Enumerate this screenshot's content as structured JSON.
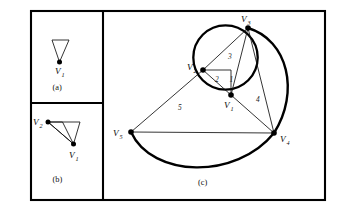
{
  "figure": {
    "kind": "geometry-diagram",
    "background_color": "#ffffff",
    "ink_color": "#000000",
    "panels": [
      {
        "id": "a",
        "caption": "(a)",
        "vertices": [
          {
            "name": "V1",
            "label": "V",
            "subscript": "1",
            "dot": true
          }
        ],
        "description": "narrow downward-pointing triangle with apex dot at V1"
      },
      {
        "id": "b",
        "caption": "(b)",
        "vertices": [
          {
            "name": "V2",
            "label": "V",
            "subscript": "2",
            "dot": true
          },
          {
            "name": "V1",
            "label": "V",
            "subscript": "1",
            "dot": true
          }
        ],
        "description": "V2 upper-left joined to V1 lower-right plus narrow triangle"
      },
      {
        "id": "c",
        "caption": "(c)",
        "vertices": [
          {
            "name": "V1",
            "label": "V",
            "subscript": "1",
            "dot": true
          },
          {
            "name": "V2",
            "label": "V",
            "subscript": "2",
            "dot": true
          },
          {
            "name": "V3",
            "label": "V",
            "subscript": "3",
            "dot": true
          },
          {
            "name": "V4",
            "label": "V",
            "subscript": "4",
            "dot": true
          },
          {
            "name": "V5",
            "label": "V",
            "subscript": "5",
            "dot": true
          }
        ],
        "angle_labels": [
          {
            "name": "region-1",
            "text": "1"
          },
          {
            "name": "region-2",
            "text": "2"
          },
          {
            "name": "region-3",
            "text": "3"
          },
          {
            "name": "region-4",
            "text": "4"
          },
          {
            "name": "region-5",
            "text": "5"
          }
        ],
        "description": "small circle through V1 V2 V3 with large circular arcs V3-V4 and V5-V4, chords V2-V5, V5-V4, V1-V4, V2-V3, V3-V4, V3-V1, V2-V1"
      }
    ]
  }
}
